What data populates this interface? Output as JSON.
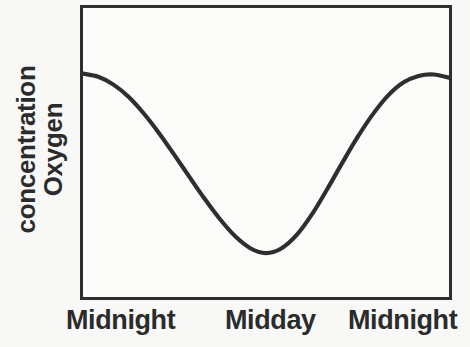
{
  "figure": {
    "background_color": "#f8f8f7",
    "line_color": "#2e2e2e",
    "frame_color": "#2e2e2e",
    "text_color": "#2b2b2b"
  },
  "axes": {
    "y_label_line1": "Oxygen",
    "y_label_line2": "concentration",
    "x_tick_labels": [
      "Midnight",
      "Midday",
      "Midnight"
    ]
  },
  "chart_data": {
    "type": "line",
    "title": "",
    "xlabel": "",
    "ylabel": "Oxygen concentration",
    "xlim": [
      0,
      24
    ],
    "ylim": [
      0,
      1
    ],
    "grid": false,
    "legend": null,
    "axis_ticks_numeric": false,
    "x_tick_positions": [
      0,
      12,
      24
    ],
    "x_tick_labels": [
      "Midnight",
      "Midday",
      "Midnight"
    ],
    "series": [
      {
        "name": "Oxygen concentration",
        "x": [
          0,
          1,
          2,
          3,
          4,
          5,
          6,
          7,
          8,
          9,
          10,
          11,
          12,
          13,
          14,
          15,
          16,
          17,
          18,
          19,
          20,
          21,
          22,
          23,
          24
        ],
        "y": [
          0.773,
          0.762,
          0.735,
          0.692,
          0.634,
          0.566,
          0.491,
          0.414,
          0.338,
          0.268,
          0.209,
          0.168,
          0.152,
          0.168,
          0.214,
          0.285,
          0.372,
          0.464,
          0.553,
          0.632,
          0.697,
          0.742,
          0.765,
          0.77,
          0.759
        ]
      }
    ],
    "annotations": []
  }
}
